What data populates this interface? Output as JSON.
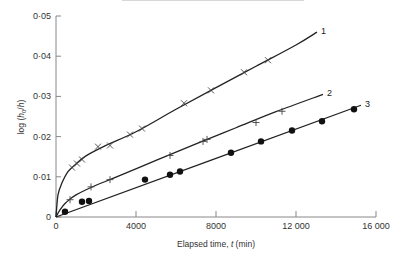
{
  "chart_data": {
    "type": "line",
    "title": "",
    "xlabel": "Elapsed time, t (min)",
    "ylabel": "log (h0/h)",
    "xlim": [
      0,
      16000
    ],
    "ylim": [
      0,
      0.05
    ],
    "x_ticks": [
      0,
      4000,
      8000,
      12000,
      16000
    ],
    "x_tick_labels": [
      "0",
      "4000",
      "8000",
      "12 000",
      "16 000"
    ],
    "y_ticks": [
      0,
      0.01,
      0.02,
      0.03,
      0.04,
      0.05
    ],
    "y_tick_labels": [
      "0",
      "0·01",
      "0·02",
      "0·03",
      "0·04",
      "0·05"
    ],
    "grid": false,
    "legend": "inline labels at line ends",
    "series": [
      {
        "name": "1",
        "marker": "x",
        "points": [
          [
            800,
            0.0123
          ],
          [
            1050,
            0.0133
          ],
          [
            1300,
            0.0143
          ],
          [
            2100,
            0.0175
          ],
          [
            2700,
            0.0178
          ],
          [
            3700,
            0.0205
          ],
          [
            4300,
            0.022
          ],
          [
            6400,
            0.0283
          ],
          [
            7750,
            0.0315
          ],
          [
            9400,
            0.036
          ],
          [
            10600,
            0.039
          ]
        ],
        "curve": [
          [
            0,
            0
          ],
          [
            100,
            0.0055
          ],
          [
            300,
            0.0085
          ],
          [
            600,
            0.0113
          ],
          [
            1000,
            0.0132
          ],
          [
            1500,
            0.0152
          ],
          [
            2500,
            0.0178
          ],
          [
            4000,
            0.0212
          ],
          [
            6000,
            0.0268
          ],
          [
            8000,
            0.0322
          ],
          [
            10000,
            0.0375
          ],
          [
            12000,
            0.0428
          ],
          [
            13050,
            0.046
          ]
        ]
      },
      {
        "name": "2",
        "marker": "+",
        "points": [
          [
            700,
            0.0043
          ],
          [
            1750,
            0.0075
          ],
          [
            2700,
            0.0093
          ],
          [
            5700,
            0.0153
          ],
          [
            7350,
            0.0188
          ],
          [
            7550,
            0.0193
          ],
          [
            10000,
            0.0235
          ],
          [
            11300,
            0.0263
          ]
        ],
        "curve": [
          [
            0,
            0
          ],
          [
            200,
            0.0018
          ],
          [
            500,
            0.0036
          ],
          [
            1000,
            0.0055
          ],
          [
            2000,
            0.0079
          ],
          [
            3000,
            0.0099
          ],
          [
            5000,
            0.0141
          ],
          [
            7000,
            0.0182
          ],
          [
            9000,
            0.0222
          ],
          [
            11000,
            0.0262
          ],
          [
            13350,
            0.0305
          ]
        ]
      },
      {
        "name": "3",
        "marker": "filled-circle",
        "points": [
          [
            450,
            0.0013
          ],
          [
            1300,
            0.0038
          ],
          [
            1650,
            0.004
          ],
          [
            4450,
            0.0093
          ],
          [
            5700,
            0.0105
          ],
          [
            6200,
            0.0113
          ],
          [
            8750,
            0.016
          ],
          [
            10250,
            0.0188
          ],
          [
            11800,
            0.0215
          ],
          [
            13300,
            0.0238
          ],
          [
            14900,
            0.0268
          ]
        ],
        "curve": [
          [
            0,
            0
          ],
          [
            15250,
            0.0278
          ]
        ]
      }
    ]
  },
  "labels": {
    "xlabel_prefix": "Elapsed time, ",
    "xlabel_var": "t",
    "xlabel_suffix": " (min)",
    "ylabel_prefix": "log (",
    "ylabel_h0": "h",
    "ylabel_sub": "0",
    "ylabel_mid": "/",
    "ylabel_h": "h",
    "ylabel_suffix": ")"
  }
}
